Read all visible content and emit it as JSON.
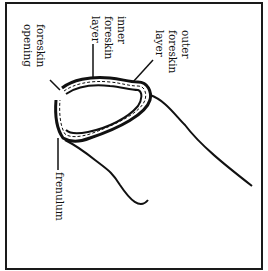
{
  "diagram": {
    "labels": {
      "outer_foreskin_layer": [
        "outer",
        "foreskin",
        "layer"
      ],
      "inner_foreskin_layer": [
        "inner",
        "foreskin",
        "layer"
      ],
      "foreskin_opening": [
        "foreskin",
        "opening"
      ],
      "frenulum": "frenulum"
    },
    "colors": {
      "line": "#111111",
      "background": "#ffffff"
    }
  }
}
